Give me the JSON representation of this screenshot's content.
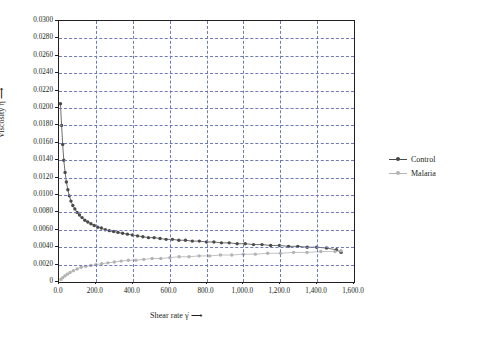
{
  "chart_data": {
    "type": "scatter",
    "title": "",
    "xlabel": "Shear rate γ̇  ⟶",
    "ylabel": "Viscosity η  ⟶",
    "unit_label": "Pa.s",
    "xlim": [
      0,
      1600
    ],
    "ylim": [
      0,
      0.03
    ],
    "grid": true,
    "legend_position": "right",
    "ytick_labels": [
      "0.0300",
      "0.0280",
      "0.0260",
      "0.0240",
      "0.0220",
      "0.0200",
      "0.0180",
      "0.0160",
      "0.0140",
      "0.0120",
      "0.0100",
      "0.0080",
      "0.0060",
      "0.0040",
      "0.0020",
      "0"
    ],
    "ytick_values": [
      0.03,
      0.028,
      0.026,
      0.024,
      0.022,
      0.02,
      0.018,
      0.016,
      0.014,
      0.012,
      0.01,
      0.008,
      0.006,
      0.004,
      0.002,
      0
    ],
    "xtick_labels": [
      "0.0",
      "200.0",
      "400.0",
      "600.0",
      "800.0",
      "1,000.0",
      "1,200.0",
      "1,400.0",
      "1,600.0"
    ],
    "xtick_values": [
      0,
      200,
      400,
      600,
      800,
      1000,
      1200,
      1400,
      1600
    ],
    "series": [
      {
        "name": "Control",
        "color": "#4a4a4a",
        "x": [
          8,
          14,
          20,
          26,
          33,
          40,
          48,
          56,
          65,
          75,
          86,
          98,
          111,
          125,
          140,
          156,
          173,
          191,
          210,
          230,
          251,
          273,
          296,
          320,
          345,
          371,
          398,
          426,
          455,
          485,
          516,
          548,
          581,
          615,
          650,
          686,
          723,
          761,
          800,
          840,
          881,
          923,
          966,
          1010,
          1055,
          1101,
          1148,
          1196,
          1245,
          1295,
          1346,
          1398,
          1451,
          1505,
          1530
        ],
        "y": [
          0.0205,
          0.018,
          0.0158,
          0.014,
          0.0126,
          0.0115,
          0.0106,
          0.0099,
          0.0093,
          0.0088,
          0.0084,
          0.008,
          0.0077,
          0.0074,
          0.0071,
          0.0069,
          0.0067,
          0.0065,
          0.0063,
          0.0062,
          0.006,
          0.0059,
          0.0058,
          0.0057,
          0.0056,
          0.0055,
          0.0054,
          0.0053,
          0.0052,
          0.0051,
          0.0051,
          0.005,
          0.0049,
          0.0049,
          0.0048,
          0.0048,
          0.0047,
          0.0047,
          0.0046,
          0.0046,
          0.0045,
          0.0045,
          0.0044,
          0.0044,
          0.0043,
          0.0043,
          0.0042,
          0.0042,
          0.0041,
          0.0041,
          0.004,
          0.004,
          0.0039,
          0.0037,
          0.0034
        ]
      },
      {
        "name": "Malaria",
        "color": "#b3b3b3",
        "x": [
          10,
          20,
          32,
          45,
          60,
          78,
          98,
          120,
          145,
          172,
          201,
          232,
          265,
          300,
          337,
          376,
          417,
          460,
          505,
          552,
          601,
          652,
          705,
          760,
          817,
          876,
          937,
          1000,
          1065,
          1132,
          1201,
          1272,
          1345,
          1420,
          1497,
          1530
        ],
        "y": [
          0.0003,
          0.0005,
          0.0007,
          0.0009,
          0.0011,
          0.0013,
          0.0015,
          0.0017,
          0.0018,
          0.0019,
          0.002,
          0.0021,
          0.0022,
          0.0023,
          0.0024,
          0.0025,
          0.0025,
          0.0026,
          0.0027,
          0.0027,
          0.0028,
          0.0029,
          0.0029,
          0.003,
          0.003,
          0.0031,
          0.0031,
          0.0032,
          0.0032,
          0.0033,
          0.0033,
          0.0034,
          0.0034,
          0.0035,
          0.0035,
          0.0036
        ]
      }
    ]
  },
  "legend": {
    "items": [
      {
        "label": "Control",
        "color": "#4a4a4a"
      },
      {
        "label": "Malaria",
        "color": "#b3b3b3"
      }
    ]
  }
}
